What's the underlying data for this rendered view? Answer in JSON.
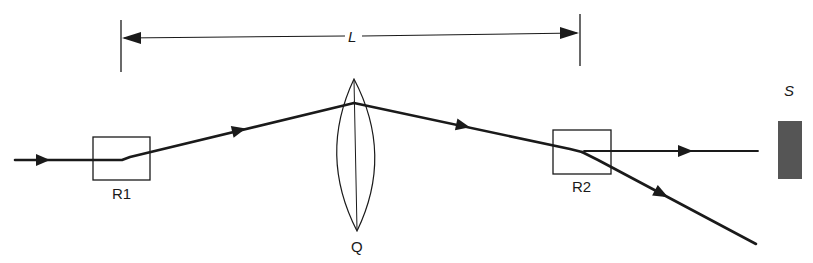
{
  "diagram": {
    "type": "optical beam path schematic",
    "dimension": {
      "label": "L",
      "from_component": "R1",
      "to_component": "R2"
    },
    "components": {
      "r1": {
        "label": "R1",
        "kind": "rectangular element"
      },
      "lens": {
        "label": "Q",
        "kind": "biconvex lens"
      },
      "r2": {
        "label": "R2",
        "kind": "rectangular element"
      },
      "screen": {
        "label": "S",
        "kind": "screen / detector"
      }
    },
    "rays": [
      {
        "name": "incident-beam",
        "direction": "left-to-right"
      },
      {
        "name": "beam-r1-to-lens",
        "direction": "upward"
      },
      {
        "name": "beam-lens-to-r2",
        "direction": "downward"
      },
      {
        "name": "undeviated-beam",
        "direction": "horizontal to screen S"
      },
      {
        "name": "deflected-beam",
        "direction": "downward-right"
      }
    ],
    "colors": {
      "ink": "#1a1a1a",
      "screen_fill": "#555555"
    }
  }
}
